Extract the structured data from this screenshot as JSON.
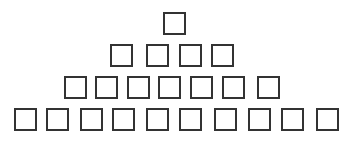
{
  "figure": {
    "rows": [
      {
        "count": 1,
        "y": 12,
        "xs": [
          163
        ]
      },
      {
        "count": 4,
        "y": 44,
        "xs": [
          110,
          146,
          179,
          211
        ]
      },
      {
        "count": 7,
        "y": 76,
        "xs": [
          64,
          95,
          127,
          158,
          190,
          222,
          257
        ]
      },
      {
        "count": 10,
        "y": 108,
        "xs": [
          14,
          46,
          80,
          112,
          146,
          179,
          214,
          248,
          281,
          316
        ]
      }
    ],
    "box_size": 23,
    "stroke_color": "#333333",
    "background": "#ffffff"
  }
}
